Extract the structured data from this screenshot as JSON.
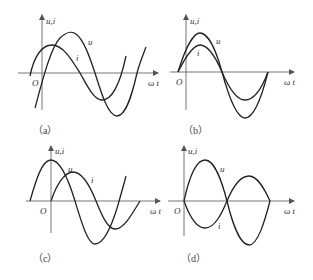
{
  "figure": {
    "axis_labels": {
      "y": "u,i",
      "x": "ω t",
      "origin": "O"
    },
    "curve_labels": {
      "voltage": "u",
      "current": "i"
    },
    "panels": [
      {
        "id": "a",
        "caption": "（a）",
        "relation": "i leads u"
      },
      {
        "id": "b",
        "caption": "（b）",
        "relation": "u and i in phase, u larger amplitude"
      },
      {
        "id": "c",
        "caption": "（c）",
        "relation": "90° phase difference"
      },
      {
        "id": "d",
        "caption": "（d）",
        "relation": "u and i in antiphase (180°)"
      }
    ]
  }
}
